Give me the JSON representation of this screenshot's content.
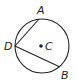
{
  "diagram": {
    "type": "circle-geometry",
    "circle": {
      "center_label": "C",
      "cx": 42,
      "cy": 46,
      "r": 27
    },
    "points": [
      {
        "label": "A",
        "x": 39,
        "y": 19,
        "lx": 37,
        "ly": 14
      },
      {
        "label": "D",
        "x": 15,
        "y": 46,
        "lx": 4,
        "ly": 50
      },
      {
        "label": "B",
        "x": 60,
        "y": 67,
        "lx": 61,
        "ly": 79
      }
    ],
    "center": {
      "label": "C",
      "x": 41,
      "y": 46,
      "lx": 45,
      "ly": 50
    },
    "chords": [
      {
        "from": "D",
        "to": "A"
      },
      {
        "from": "D",
        "to": "B"
      }
    ],
    "colors": {
      "stroke": "#222222",
      "background": "#ffffff"
    }
  }
}
